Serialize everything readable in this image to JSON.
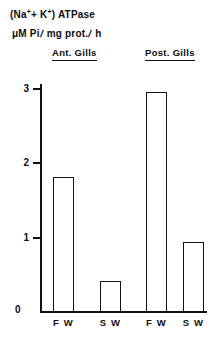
{
  "title": {
    "line1_prefix": "(Na",
    "line1_sup1": "+",
    "line1_mid": "+ K",
    "line1_sup2": "+",
    "line1_suffix": ") ATPase",
    "line2_part1": "μM Pi",
    "line2_slash1": "/",
    "line2_part2": "mg prot.",
    "line2_slash2": "/",
    "line2_part3": "h",
    "full_line1": "(Na+ + K+) ATPase",
    "full_line2": "μM Pi/ mg prot./ h"
  },
  "groups": [
    {
      "label": "Ant. Gills"
    },
    {
      "label": "Post. Gills"
    }
  ],
  "axis": {
    "y_ticks": [
      "3",
      "2",
      "1"
    ],
    "zero_label": "0"
  },
  "chart_data": {
    "type": "bar",
    "ylabel": "μM Pi/ mg prot./ h",
    "xlabel": "",
    "ylim": [
      0,
      3.2
    ],
    "yticks": [
      0,
      1,
      2,
      3
    ],
    "grid": false,
    "legend": "none",
    "groups": [
      "Ant. Gills",
      "Post. Gills"
    ],
    "categories": [
      "F W",
      "S W",
      "F W",
      "S W"
    ],
    "values": [
      1.8,
      0.4,
      2.93,
      0.93
    ],
    "series": [
      {
        "name": "(Na+ + K+) ATPase activity",
        "values": [
          1.8,
          0.4,
          2.93,
          0.93
        ]
      }
    ],
    "bars": [
      {
        "group": "Ant. Gills",
        "category": "F W",
        "value": 1.8
      },
      {
        "group": "Ant. Gills",
        "category": "S W",
        "value": 0.4
      },
      {
        "group": "Post. Gills",
        "category": "F W",
        "value": 2.93
      },
      {
        "group": "Post. Gills",
        "category": "S W",
        "value": 0.93
      }
    ],
    "bar_style": {
      "fill": "#ffffff",
      "stroke": "#141414"
    }
  },
  "layout": {
    "baseline_y": 311,
    "px_per_unit": 74.7,
    "bar_geometry": [
      {
        "left": 53,
        "width": 21
      },
      {
        "left": 100,
        "width": 21
      },
      {
        "left": 146,
        "width": 21
      },
      {
        "left": 183,
        "width": 21
      }
    ],
    "tick_y": [
      88,
      162,
      237
    ],
    "x_label_centers": [
      63.5,
      110.5,
      156.5,
      193.5
    ]
  }
}
